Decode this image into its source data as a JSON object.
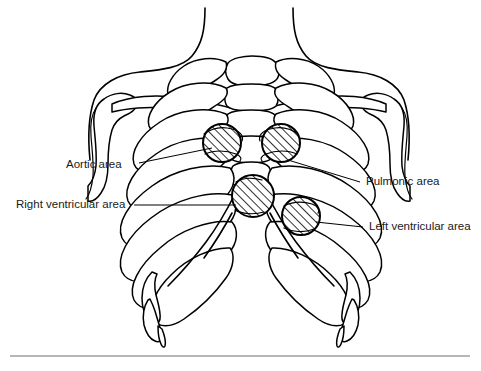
{
  "figure": {
    "background_color": "#ffffff",
    "line_color": "#000000",
    "rule_color": "#6e6e6e",
    "width": 481,
    "height": 371
  },
  "labels": {
    "aortic": "Aortic area",
    "right_ventricular": "Right ventricular area",
    "pulmonic": "Pulmonic area",
    "left_ventricular": "Left ventricular area"
  },
  "areas": [
    {
      "key": "aortic",
      "label": "Aortic area",
      "cx": 222,
      "cy": 143,
      "r": 19,
      "hatch": "diagonal"
    },
    {
      "key": "pulmonic",
      "label": "Pulmonic area",
      "cx": 281,
      "cy": 143,
      "r": 19,
      "hatch": "diagonal"
    },
    {
      "key": "right_ventricular",
      "label": "Right ventricular area",
      "cx": 253,
      "cy": 196,
      "r": 21,
      "hatch": "diagonal"
    },
    {
      "key": "left_ventricular",
      "label": "Left ventricular area",
      "cx": 301,
      "cy": 216,
      "r": 19,
      "hatch": "diagonal"
    }
  ],
  "leaders": [
    {
      "key": "aortic",
      "x1": 139,
      "y1": 163,
      "x2": 212,
      "y2": 148
    },
    {
      "key": "right_ventricular",
      "x1": 134,
      "y1": 205,
      "x2": 236,
      "y2": 205
    },
    {
      "key": "pulmonic",
      "x1": 360,
      "y1": 182,
      "x2": 288,
      "y2": 160
    },
    {
      "key": "left_ventricular",
      "x1": 363,
      "y1": 227,
      "x2": 316,
      "y2": 222
    }
  ],
  "rule": {
    "x1": 10,
    "x2": 470,
    "y": 356
  }
}
